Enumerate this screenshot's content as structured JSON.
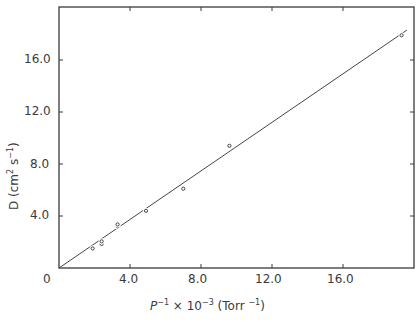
{
  "chart_data": {
    "type": "scatter",
    "title": "",
    "xlabel": "P^-1 × 10^-3 (Torr^-1)",
    "ylabel": "D (cm^2 s^-1)",
    "xlim": [
      0,
      20
    ],
    "ylim": [
      0,
      20
    ],
    "grid": false,
    "legend": null,
    "x_ticks": [
      "0",
      "4.0",
      "8.0",
      "12.0",
      "16.0"
    ],
    "y_ticks": [
      "4.0",
      "8.0",
      "12.0",
      "16.0"
    ],
    "series": [
      {
        "name": "measured",
        "marker": "open-circle",
        "points": [
          {
            "x": 1.9,
            "y": 1.5
          },
          {
            "x": 2.4,
            "y": 1.85
          },
          {
            "x": 2.4,
            "y": 2.05
          },
          {
            "x": 3.3,
            "y": 3.2
          },
          {
            "x": 3.3,
            "y": 3.35
          },
          {
            "x": 4.9,
            "y": 4.4
          },
          {
            "x": 7.0,
            "y": 6.1
          },
          {
            "x": 9.6,
            "y": 9.4
          },
          {
            "x": 19.3,
            "y": 17.9
          }
        ]
      },
      {
        "name": "fit",
        "type": "line",
        "points": [
          {
            "x": 0,
            "y": 0
          },
          {
            "x": 19.6,
            "y": 18.3
          }
        ]
      }
    ]
  },
  "labels": {
    "x_origin": "0",
    "x_ticks": [
      "4.0",
      "8.0",
      "12.0",
      "16.0"
    ],
    "y_ticks": [
      "4.0",
      "8.0",
      "12.0",
      "16.0"
    ],
    "xlabel_p": "P",
    "xlabel_sup1": "−1",
    "xlabel_mid": " × 10",
    "xlabel_sup2": "−3",
    "xlabel_unit": " (Torr ",
    "xlabel_sup3": "−1",
    "xlabel_end": ")",
    "ylabel_main": "D (cm",
    "ylabel_sup1": "2",
    "ylabel_mid": " s",
    "ylabel_sup2": "−1",
    "ylabel_end": ")"
  },
  "colors": {
    "axis": "#3a3a3a",
    "line": "#444444",
    "marker": "#444444"
  }
}
